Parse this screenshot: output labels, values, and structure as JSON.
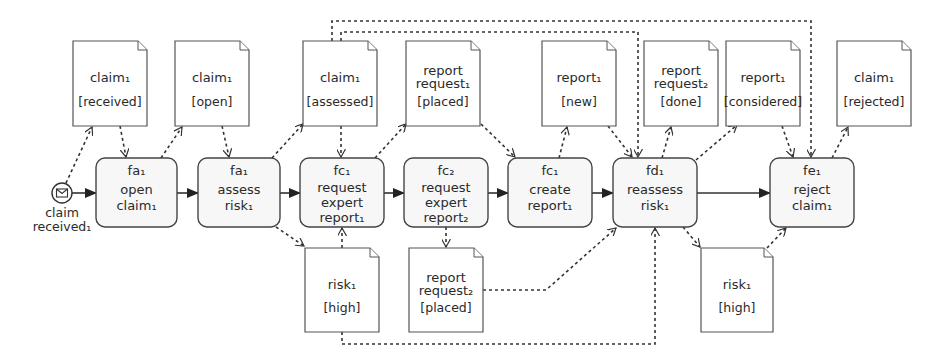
{
  "diagram": {
    "type": "BPMN process with data objects",
    "start_event": {
      "id": "ev",
      "label_lines": [
        "claim",
        "received₁"
      ],
      "icon": "envelope-icon",
      "cx": 62,
      "cy": 193,
      "r": 10
    },
    "tasks": [
      {
        "id": "t1",
        "role": "fa₁",
        "lines": [
          "open",
          "claim₁"
        ],
        "x": 96,
        "y": 158,
        "w": 81,
        "h": 69
      },
      {
        "id": "t2",
        "role": "fa₁",
        "lines": [
          "assess",
          "risk₁"
        ],
        "x": 198,
        "y": 158,
        "w": 82,
        "h": 69
      },
      {
        "id": "t3",
        "role": "fc₁",
        "lines": [
          "request",
          "expert",
          "report₁"
        ],
        "x": 300,
        "y": 158,
        "w": 84,
        "h": 69
      },
      {
        "id": "t4",
        "role": "fc₂",
        "lines": [
          "request",
          "expert",
          "report₂"
        ],
        "x": 404,
        "y": 158,
        "w": 84,
        "h": 69
      },
      {
        "id": "t5",
        "role": "fc₁",
        "lines": [
          "create",
          "report₁"
        ],
        "x": 508,
        "y": 158,
        "w": 84,
        "h": 69
      },
      {
        "id": "t6",
        "role": "fd₁",
        "lines": [
          "reassess",
          "risk₁"
        ],
        "x": 613,
        "y": 158,
        "w": 84,
        "h": 69
      },
      {
        "id": "t7",
        "role": "fe₁",
        "lines": [
          "reject",
          "claim₁"
        ],
        "x": 770,
        "y": 158,
        "w": 84,
        "h": 69
      }
    ],
    "data_objects": [
      {
        "id": "d1",
        "name_lines": [
          "claim₁"
        ],
        "state": "[received]",
        "x": 73,
        "y": 41,
        "w": 74,
        "h": 85
      },
      {
        "id": "d2",
        "name_lines": [
          "claim₁"
        ],
        "state": "[open]",
        "x": 175,
        "y": 41,
        "w": 74,
        "h": 85
      },
      {
        "id": "d3",
        "name_lines": [
          "claim₁"
        ],
        "state": "[assessed]",
        "x": 303,
        "y": 41,
        "w": 74,
        "h": 85
      },
      {
        "id": "d4",
        "name_lines": [
          "report",
          "request₁"
        ],
        "state": "[placed]",
        "x": 406,
        "y": 41,
        "w": 74,
        "h": 85
      },
      {
        "id": "d5",
        "name_lines": [
          "report₁"
        ],
        "state": "[new]",
        "x": 542,
        "y": 41,
        "w": 74,
        "h": 85
      },
      {
        "id": "d6",
        "name_lines": [
          "report",
          "request₂"
        ],
        "state": "[done]",
        "x": 644,
        "y": 41,
        "w": 74,
        "h": 85
      },
      {
        "id": "d7",
        "name_lines": [
          "report₁"
        ],
        "state": "[considered]",
        "x": 726,
        "y": 41,
        "w": 74,
        "h": 85
      },
      {
        "id": "d8",
        "name_lines": [
          "claim₁"
        ],
        "state": "[rejected]",
        "x": 837,
        "y": 41,
        "w": 74,
        "h": 85
      },
      {
        "id": "d9",
        "name_lines": [
          "risk₁"
        ],
        "state": "[high]",
        "x": 305,
        "y": 248,
        "w": 74,
        "h": 84
      },
      {
        "id": "d10",
        "name_lines": [
          "report",
          "request₂"
        ],
        "state": "[placed]",
        "x": 409,
        "y": 248,
        "w": 74,
        "h": 84
      },
      {
        "id": "d11",
        "name_lines": [
          "risk₁"
        ],
        "state": "[high]",
        "x": 701,
        "y": 248,
        "w": 72,
        "h": 84
      }
    ],
    "sequence_flows": [
      {
        "from": "ev",
        "to": "t1",
        "points": [
          [
            72,
            193
          ],
          [
            96,
            193
          ]
        ]
      },
      {
        "from": "t1",
        "to": "t2",
        "points": [
          [
            177,
            193
          ],
          [
            198,
            193
          ]
        ]
      },
      {
        "from": "t2",
        "to": "t3",
        "points": [
          [
            280,
            193
          ],
          [
            300,
            193
          ]
        ]
      },
      {
        "from": "t3",
        "to": "t4",
        "points": [
          [
            384,
            193
          ],
          [
            404,
            193
          ]
        ]
      },
      {
        "from": "t4",
        "to": "t5",
        "points": [
          [
            488,
            193
          ],
          [
            508,
            193
          ]
        ]
      },
      {
        "from": "t5",
        "to": "t6",
        "points": [
          [
            592,
            193
          ],
          [
            613,
            193
          ]
        ]
      },
      {
        "from": "t6",
        "to": "t7",
        "points": [
          [
            697,
            193
          ],
          [
            770,
            193
          ]
        ]
      }
    ],
    "associations": [
      {
        "from": "ev",
        "to": "d1",
        "points": [
          [
            66,
            183
          ],
          [
            92,
            127
          ]
        ]
      },
      {
        "from": "d1",
        "to": "t1",
        "points": [
          [
            120,
            126
          ],
          [
            126,
            157
          ]
        ]
      },
      {
        "from": "t1",
        "to": "d2",
        "points": [
          [
            161,
            158
          ],
          [
            182,
            127
          ]
        ]
      },
      {
        "from": "d2",
        "to": "t2",
        "points": [
          [
            222,
            126
          ],
          [
            229,
            157
          ]
        ]
      },
      {
        "from": "t2",
        "to": "d3",
        "points": [
          [
            272,
            158
          ],
          [
            303,
            124
          ]
        ]
      },
      {
        "from": "d3",
        "to": "t3",
        "points": [
          [
            341,
            126
          ],
          [
            341,
            157
          ]
        ]
      },
      {
        "from": "t3",
        "to": "d4",
        "points": [
          [
            375,
            158
          ],
          [
            406,
            124
          ]
        ]
      },
      {
        "from": "d4",
        "to": "t5",
        "points": [
          [
            481,
            124
          ],
          [
            515,
            157
          ]
        ]
      },
      {
        "from": "t5",
        "to": "d5",
        "points": [
          [
            559,
            158
          ],
          [
            567,
            127
          ]
        ]
      },
      {
        "from": "d5",
        "to": "t6",
        "points": [
          [
            608,
            126
          ],
          [
            632,
            157
          ]
        ]
      },
      {
        "from": "t6",
        "to": "d6",
        "points": [
          [
            662,
            158
          ],
          [
            671,
            127
          ]
        ]
      },
      {
        "from": "t6",
        "to": "d7",
        "points": [
          [
            696,
            160
          ],
          [
            737,
            125
          ]
        ]
      },
      {
        "from": "d7",
        "to": "t7",
        "points": [
          [
            782,
            126
          ],
          [
            793,
            157
          ]
        ]
      },
      {
        "from": "t7",
        "to": "d8",
        "points": [
          [
            832,
            158
          ],
          [
            848,
            127
          ]
        ]
      },
      {
        "from": "t2",
        "to": "d9",
        "points": [
          [
            276,
            227
          ],
          [
            304,
            246
          ]
        ]
      },
      {
        "from": "d9",
        "to": "t3",
        "points": [
          [
            342,
            248
          ],
          [
            342,
            228
          ]
        ]
      },
      {
        "from": "t4",
        "to": "d10",
        "points": [
          [
            446,
            227
          ],
          [
            446,
            247
          ]
        ]
      },
      {
        "from": "d10",
        "to": "t6",
        "points": [
          [
            483,
            290
          ],
          [
            546,
            290
          ],
          [
            616,
            228
          ]
        ]
      },
      {
        "from": "t6",
        "to": "d11",
        "points": [
          [
            683,
            227
          ],
          [
            700,
            247
          ]
        ]
      },
      {
        "from": "d11",
        "to": "t7",
        "points": [
          [
            767,
            248
          ],
          [
            786,
            228
          ]
        ]
      },
      {
        "from": "d9",
        "to": "t6",
        "points": [
          [
            342,
            332
          ],
          [
            342,
            344
          ],
          [
            655,
            344
          ],
          [
            655,
            228
          ]
        ]
      },
      {
        "from": "d3",
        "to": "t6",
        "points": [
          [
            341,
            41
          ],
          [
            341,
            32
          ],
          [
            638,
            32
          ],
          [
            638,
            157
          ]
        ]
      },
      {
        "from": "d3",
        "to": "t7",
        "points": [
          [
            332,
            41
          ],
          [
            332,
            21
          ],
          [
            811,
            21
          ],
          [
            811,
            157
          ]
        ]
      }
    ]
  }
}
